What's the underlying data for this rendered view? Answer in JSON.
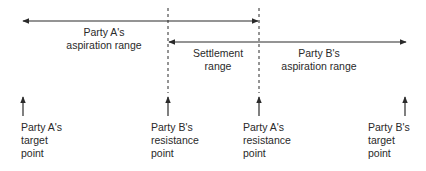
{
  "diagram": {
    "colors": {
      "line": "#2a2a2a",
      "background": "#ffffff"
    },
    "ranges": [
      {
        "id": "party-a-aspiration",
        "lines": [
          "Party A's",
          "aspiration range"
        ]
      },
      {
        "id": "settlement",
        "lines": [
          "Settlement",
          "range"
        ]
      },
      {
        "id": "party-b-aspiration",
        "lines": [
          "Party B's",
          "aspiration range"
        ]
      }
    ],
    "points": [
      {
        "id": "party-a-target",
        "lines": [
          "Party A's",
          "target",
          "point"
        ]
      },
      {
        "id": "party-b-resistance",
        "lines": [
          "Party B's",
          "resistance",
          "point"
        ]
      },
      {
        "id": "party-a-resistance",
        "lines": [
          "Party A's",
          "resistance",
          "point"
        ]
      },
      {
        "id": "party-b-target",
        "lines": [
          "Party B's",
          "target",
          "point"
        ]
      }
    ]
  }
}
